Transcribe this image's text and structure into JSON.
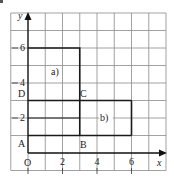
{
  "diagram": {
    "type": "coordinate-grid",
    "grid": {
      "x_min": -1,
      "x_max": 8,
      "y_min": -1,
      "y_max": 8,
      "step": 1
    },
    "axes": {
      "x_label": "x",
      "y_label": "y",
      "origin_label": "O",
      "x_ticks": [
        {
          "value": 2,
          "label": "2"
        },
        {
          "value": 4,
          "label": "4"
        },
        {
          "value": 6,
          "label": "6"
        }
      ],
      "y_ticks": [
        {
          "value": 2,
          "label": "2"
        },
        {
          "value": 4,
          "label": "4"
        },
        {
          "value": 6,
          "label": "6"
        }
      ]
    },
    "points": [
      {
        "name": "A",
        "x": 0,
        "y": 1
      },
      {
        "name": "B",
        "x": 3,
        "y": 1
      },
      {
        "name": "C",
        "x": 3,
        "y": 3
      },
      {
        "name": "D",
        "x": 0,
        "y": 3
      }
    ],
    "regions": [
      {
        "label": "a)",
        "description": "rectangle from (0,6) to (3,1)"
      },
      {
        "label": "b)",
        "description": "rectangle from (0,3) to (6,1)"
      }
    ],
    "colors": {
      "grid": "#8a8a8a",
      "outline": "#1a1a1a",
      "background": "#ffffff"
    }
  }
}
